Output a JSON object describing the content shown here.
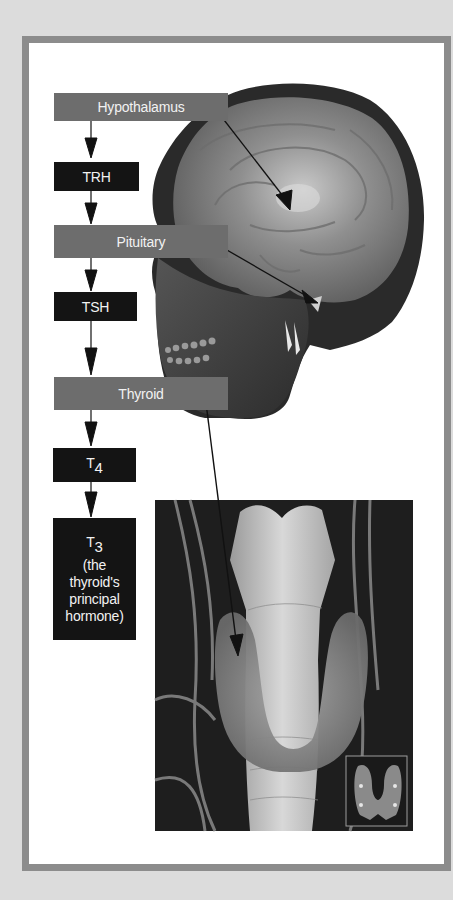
{
  "figure": {
    "flow": [
      {
        "id": "hypothalamus",
        "label": "Hypothalamus",
        "style": "gray"
      },
      {
        "id": "trh",
        "label": "TRH",
        "style": "black"
      },
      {
        "id": "pituitary",
        "label": "Pituitary",
        "style": "gray"
      },
      {
        "id": "tsh",
        "label": "TSH",
        "style": "black"
      },
      {
        "id": "thyroid",
        "label": "Thyroid",
        "style": "gray"
      },
      {
        "id": "t4",
        "label": "T",
        "subscript": "4",
        "style": "black"
      },
      {
        "id": "t3",
        "label": "T",
        "subscript": "3",
        "caption_lines": [
          "(the",
          "thyroid's",
          "principal",
          "hormone)"
        ],
        "style": "black"
      }
    ],
    "images": [
      {
        "id": "head-illustration",
        "description": "Sagittal 3D view of human head showing brain and skull"
      },
      {
        "id": "thyroid-photo",
        "description": "Anatomical render of thyroid gland around trachea"
      },
      {
        "id": "thyroid-inset",
        "description": "Small inset of butterfly-shaped thyroid with 4 parathyroid dots"
      }
    ],
    "colors": {
      "background": "#dcdcdc",
      "frame_border": "#8c8c8c",
      "gray_box": "#6d6d6d",
      "black_box": "#141414",
      "text": "#f2f2f2"
    }
  }
}
